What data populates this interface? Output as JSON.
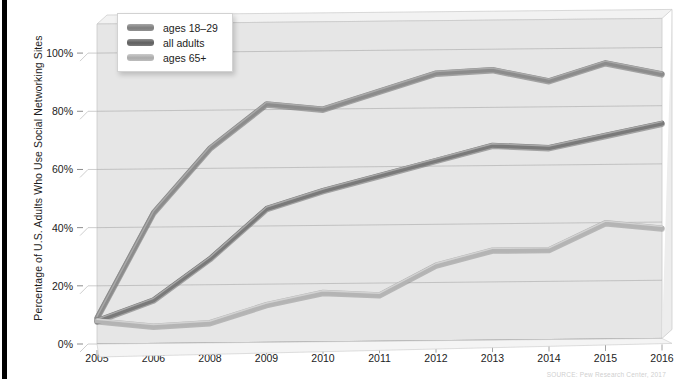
{
  "chart_data": {
    "type": "line",
    "title": "",
    "xlabel": "",
    "ylabel": "Percentage of U.S. Adults Who Use Social Networking Sites",
    "categories": [
      "2005",
      "2006",
      "2008",
      "2009",
      "2010",
      "2011",
      "2012",
      "2013",
      "2014",
      "2015",
      "2016"
    ],
    "ylim": [
      0,
      110
    ],
    "yticks": [
      0,
      20,
      40,
      60,
      80,
      100
    ],
    "ytick_labels": [
      "0%",
      "20%",
      "40%",
      "60%",
      "80%",
      "100%"
    ],
    "grid": true,
    "legend_position": "top-left",
    "series": [
      {
        "name": "ages 18–29",
        "color": "#8c8c8c",
        "values": [
          9,
          45,
          67,
          82,
          80,
          86,
          92,
          93,
          89,
          95,
          91
        ]
      },
      {
        "name": "all adults",
        "color": "#7a7a7a",
        "values": [
          8,
          15,
          29,
          46,
          52,
          57,
          62,
          67,
          66,
          70,
          74
        ]
      },
      {
        "name": "ages 65+",
        "color": "#b4b4b4",
        "values": [
          8,
          6,
          7,
          13,
          17,
          16,
          26,
          31,
          31,
          40,
          38
        ]
      }
    ],
    "source": "SOURCE: Pew Research Center, 2017"
  },
  "legend": {
    "items": [
      {
        "label": "ages 18–29",
        "swatch_color": "#8c8c8c"
      },
      {
        "label": "all adults",
        "swatch_color": "#6f6f6f"
      },
      {
        "label": "ages 65+",
        "swatch_color": "#b8b8b8"
      }
    ]
  },
  "colors": {
    "plot_background": "#e6e6e6",
    "gridline": "#a9a9a9",
    "text": "#1c1c1c",
    "edge_strip": "#000000"
  }
}
